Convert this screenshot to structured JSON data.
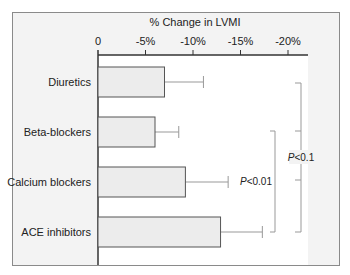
{
  "chart_data": {
    "type": "bar",
    "orientation": "horizontal",
    "title": "% Change in LVMI",
    "xlabel": "% Change in LVMI",
    "ylabel": "",
    "xlim": [
      0,
      -22
    ],
    "x_ticks": [
      "0",
      "-5%",
      "-10%",
      "-15%",
      "-20%"
    ],
    "x_tick_values": [
      0,
      -5,
      -10,
      -15,
      -20
    ],
    "categories": [
      "Diuretics",
      "Beta-blockers",
      "Calcium blockers",
      "ACE inhibitors"
    ],
    "values": [
      -7,
      -6,
      -9.2,
      -12.9
    ],
    "error_upper": [
      4.1,
      2.5,
      4.5,
      4.4
    ],
    "annotations": [
      {
        "label": "P<0.01",
        "italic_prefix": "P",
        "rest": "<0.01",
        "from": "Beta-blockers",
        "to": "ACE inhibitors"
      },
      {
        "label": "P<0.1",
        "italic_prefix": "P",
        "rest": "<0.1",
        "from": "Diuretics",
        "to": "ACE inhibitors"
      }
    ],
    "grid": false,
    "legend": null,
    "colors": {
      "bar_fill": "#ececec",
      "bar_stroke": "#555555",
      "axis": "#333333",
      "error": "#999999",
      "bracket": "#999999",
      "frame_bg": "#f3f3f3"
    }
  }
}
